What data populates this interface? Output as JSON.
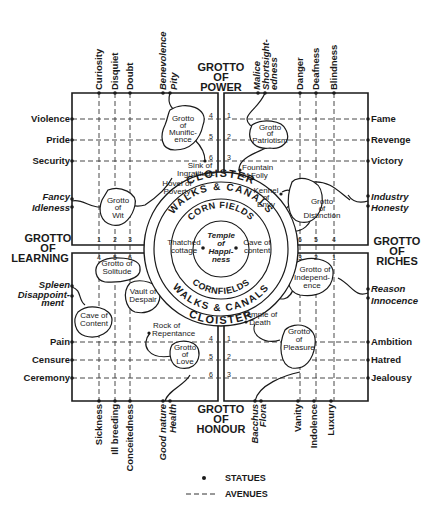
{
  "colors": {
    "ink": "#1a1a1a",
    "paper": "#ffffff"
  },
  "grottoes": {
    "power": [
      "GROTTO",
      "OF",
      "POWER"
    ],
    "learning": [
      "GROTTO",
      "OF",
      "LEARNING"
    ],
    "riches": [
      "GROTTO",
      "OF",
      "RICHES"
    ],
    "honour": [
      "GROTTO",
      "OF",
      "HONOUR"
    ]
  },
  "top_statues": {
    "left": [
      "Curiosity",
      "Disquiet",
      "Doubt"
    ],
    "left_italic": [
      "Benevolence",
      "Pity"
    ],
    "right_italic": [
      "Malice",
      "Shortsight-",
      "edness"
    ],
    "right": [
      "Danger",
      "Deafness",
      "Blindness"
    ]
  },
  "bottom_statues": {
    "left": [
      "Sickness",
      "Ill breeding",
      "Conceitedness"
    ],
    "left_italic": [
      "Good nature",
      "Health"
    ],
    "right_italic": [
      "Bacchus",
      "Flora"
    ],
    "right": [
      "Vanity",
      "Indolence",
      "Luxury"
    ]
  },
  "left_statues": {
    "top": [
      "Violence",
      "Pride",
      "Security"
    ],
    "italic_top": [
      "Fancy",
      "Idleness"
    ],
    "italic_bottom": [
      "Spleen",
      "Disappoint-",
      "ment"
    ],
    "bottom": [
      "Pain",
      "Censure",
      "Ceremony"
    ]
  },
  "right_statues": {
    "top": [
      "Fame",
      "Revenge",
      "Victory"
    ],
    "italic_top": [
      "Industry",
      "Honesty"
    ],
    "italic_bottom": [
      "Reason",
      "Innocence"
    ],
    "bottom": [
      "Ambition",
      "Hatred",
      "Jealousy"
    ]
  },
  "features": {
    "munificence": [
      "Grotto",
      "of",
      "Munific-",
      "ence"
    ],
    "patriotism": [
      "Grotto",
      "of",
      "Patriotism"
    ],
    "sink": [
      "Sink of",
      "Ingratitude"
    ],
    "fountain": [
      "Fountain",
      "of Folly"
    ],
    "hovel": [
      "Hovel of",
      "Poverty"
    ],
    "kennel": [
      "Kennel",
      "of",
      "Envy"
    ],
    "wit": [
      "Grotto",
      "of",
      "Wit"
    ],
    "distinction": [
      "Grotto",
      "of",
      "Distinction"
    ],
    "solitude": [
      "Grotto of",
      "Solitude"
    ],
    "despair": [
      "Vault of",
      "Despair"
    ],
    "cave_content_left": [
      "Cave of",
      "Content"
    ],
    "independence": [
      "Grotto of",
      "Independ-",
      "ence"
    ],
    "rock": [
      "Rock of",
      "Repentance"
    ],
    "death": [
      "Temple of",
      "Death"
    ],
    "love": [
      "Grotto",
      "of",
      "Love"
    ],
    "pleasure": [
      "Grotto",
      "of",
      "Pleasure"
    ]
  },
  "center": {
    "cloister": "CLOISTER",
    "walks": "WALKS & CANALS",
    "corn_top": "CORN FIELDS",
    "corn_bottom": "CORNFIELDS",
    "temple": [
      "Temple",
      "of",
      "Happi-",
      "ness"
    ],
    "thatched": [
      "Thatched",
      "cottage"
    ],
    "cave": [
      "Cave of",
      "content"
    ]
  },
  "avenue_numbers": {
    "top_left": [
      "4",
      "5",
      "6"
    ],
    "top_right": [
      "1",
      "2",
      "3"
    ],
    "bottom_left": [
      "4",
      "5",
      "6"
    ],
    "bottom_right": [
      "1",
      "2",
      "3"
    ],
    "left_upper": [
      "1",
      "2",
      "3"
    ],
    "left_lower": [
      "4",
      "5",
      "6"
    ],
    "right_upper": [
      "6",
      "5",
      "4"
    ],
    "right_lower": [
      "3",
      "2",
      "1"
    ]
  },
  "legend": {
    "statues": "STATUES",
    "avenues": "AVENUES"
  }
}
